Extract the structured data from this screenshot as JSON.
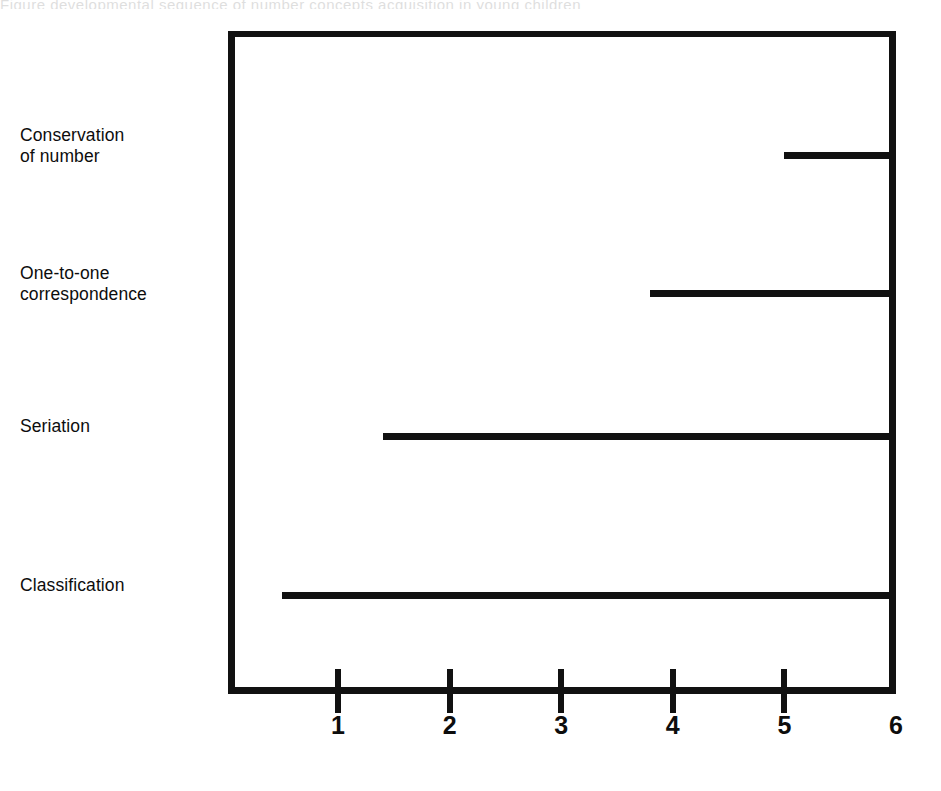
{
  "figure": {
    "top_artifact_text": "Figure   developmental sequence  of   number concepts  acquisition in young children"
  },
  "chart_data": {
    "type": "bar",
    "orientation": "horizontal",
    "title": "",
    "subtitle": "",
    "xlabel": "",
    "ylabel": "",
    "xlim": [
      0,
      6
    ],
    "ylim": [
      0,
      4
    ],
    "grid": false,
    "legend": null,
    "bar_style": "range-line",
    "categories": [
      "Conservation of number",
      "One-to-one correspondence",
      "Seriation",
      "Classification"
    ],
    "category_lines": [
      [
        "Conservation",
        "of number"
      ],
      [
        "One-to-one",
        "correspondence"
      ],
      [
        "Seriation"
      ],
      [
        "Classification"
      ]
    ],
    "series": [
      {
        "name": "age span",
        "starts": [
          5.0,
          3.8,
          1.4,
          0.5
        ],
        "ends": [
          6.0,
          6.0,
          6.0,
          6.0
        ],
        "values": [
          1.0,
          2.2,
          4.6,
          5.5
        ]
      }
    ],
    "xticks": [
      1,
      2,
      3,
      4,
      5,
      6
    ],
    "xticklabels": [
      "1",
      "2",
      "3",
      "4",
      "5",
      "6"
    ],
    "colors": {
      "bar": "#111111",
      "axis": "#111111",
      "text": "#0d0d0d",
      "background": "#ffffff"
    }
  }
}
